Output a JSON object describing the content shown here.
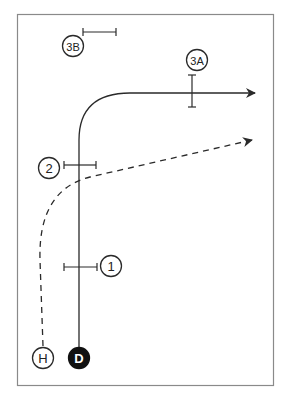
{
  "diagram": {
    "type": "play-diagram",
    "colors": {
      "line": "#2a2a2a",
      "border": "#8a8a8a",
      "defender_fill": "#111111",
      "background": "#ffffff"
    },
    "players": [
      {
        "id": "3B",
        "label": "3B",
        "role": "defender-zone",
        "filled": false
      },
      {
        "id": "3A",
        "label": "3A",
        "role": "defender-zone",
        "filled": false
      },
      {
        "id": "2",
        "label": "2",
        "role": "defender-zone",
        "filled": false
      },
      {
        "id": "1",
        "label": "1",
        "role": "defender-zone",
        "filled": false
      },
      {
        "id": "H",
        "label": "H",
        "role": "offense",
        "filled": false
      },
      {
        "id": "D",
        "label": "D",
        "role": "offense",
        "filled": true
      }
    ],
    "routes": [
      {
        "from": "D",
        "style": "solid",
        "description": "vertical then out to right"
      },
      {
        "from": "H",
        "style": "dashed",
        "description": "wheel up and to the right"
      }
    ]
  }
}
